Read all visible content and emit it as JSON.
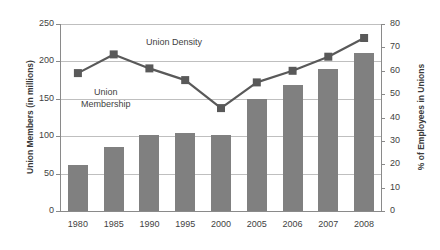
{
  "chart_data": {
    "type": "bar",
    "title": "",
    "subtitle": "",
    "categories": [
      "1980",
      "1985",
      "1990",
      "1995",
      "2000",
      "2005",
      "2006",
      "2007",
      "2008"
    ],
    "xlabel": "",
    "ylabel": "Union Members (in millions)",
    "ylabel_secondary": "% of Employees in Unions",
    "ylim": [
      0,
      250
    ],
    "ylim_secondary": [
      0,
      80
    ],
    "yticks": [
      0,
      50,
      100,
      150,
      200,
      250
    ],
    "yticks_secondary": [
      0,
      10,
      20,
      30,
      40,
      50,
      60,
      70,
      80
    ],
    "grid": true,
    "legend_position": "in-plot-annotations",
    "series": [
      {
        "name": "Union Membership",
        "type": "bar",
        "axis": "left",
        "unit": "millions",
        "color": "#808080",
        "values": [
          61,
          85,
          101,
          104,
          102,
          150,
          168,
          190,
          211
        ]
      },
      {
        "name": "Union Density",
        "type": "line",
        "axis": "right",
        "unit": "percent",
        "color": "#595959",
        "marker": "square",
        "values": [
          59,
          67,
          61,
          56,
          44,
          55,
          60,
          66,
          74
        ]
      }
    ],
    "annotations": [
      {
        "text": "Union Density",
        "series": "Union Density"
      },
      {
        "text": "Union",
        "series": "Union Membership"
      },
      {
        "text": "Membership",
        "series": "Union Membership"
      }
    ]
  },
  "labels": {
    "axis_left_title": "Union Members (in millions)",
    "axis_right_title": "% of Employees in Unions",
    "annotation_density": "Union Density",
    "annotation_membership_line1": "Union",
    "annotation_membership_line2": "Membership"
  }
}
